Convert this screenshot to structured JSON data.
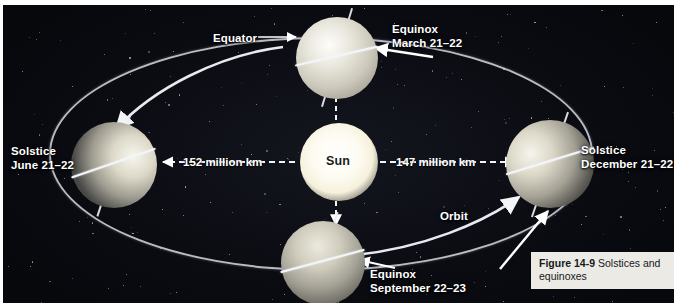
{
  "figure": {
    "number": "Figure 14-9",
    "caption": "Solstices and equinoxes"
  },
  "sun": {
    "label": "Sun"
  },
  "labels": {
    "equator": "Equator",
    "orbit": "Orbit"
  },
  "positions": [
    {
      "key": "march",
      "event": "Equinox",
      "date": "March 21–22"
    },
    {
      "key": "june",
      "event": "Solstice",
      "date": "June 21–22"
    },
    {
      "key": "september",
      "event": "Equinox",
      "date": "September 22–23"
    },
    {
      "key": "december",
      "event": "Solstice",
      "date": "December 21–22"
    }
  ],
  "distances": {
    "aphelion": "152 million km",
    "perihelion": "147 million km"
  },
  "colors": {
    "space": "#0b0c12",
    "sun": "#fdfbf1",
    "orbit_line": "#cfd4dd",
    "label_text": "#ffffff",
    "caption_bg": "#eceae4"
  }
}
